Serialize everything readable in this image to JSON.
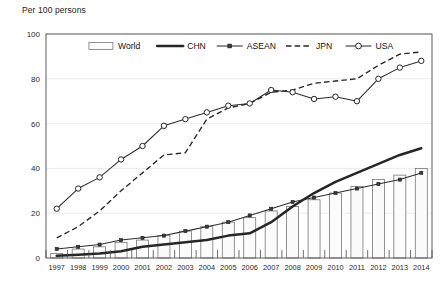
{
  "chart_data": {
    "type": "line",
    "title": "",
    "ylabel": "Per 100 persons",
    "xlabel": "",
    "ylim": [
      0,
      100
    ],
    "yticks": [
      0,
      20,
      40,
      60,
      80,
      100
    ],
    "grid": true,
    "legend_position": "top-center",
    "categories": [
      "1997",
      "1998",
      "1999",
      "2000",
      "2001",
      "2002",
      "2003",
      "2004",
      "2005",
      "2006",
      "2007",
      "2008",
      "2009",
      "2010",
      "2011",
      "2012",
      "2013",
      "2014"
    ],
    "x": [
      1997,
      1998,
      1999,
      2000,
      2001,
      2002,
      2003,
      2004,
      2005,
      2006,
      2007,
      2008,
      2009,
      2010,
      2011,
      2012,
      2013,
      2014
    ],
    "series": [
      {
        "name": "World",
        "type": "bar",
        "style": "hollow-bar",
        "color": "#fbfbfb",
        "edge_color": "#6e6e6e",
        "values": [
          2,
          4,
          5,
          7,
          8,
          10,
          12,
          14,
          16,
          18,
          21,
          23,
          26,
          29,
          32,
          35,
          37,
          40
        ]
      },
      {
        "name": "CHN",
        "type": "line",
        "style": "thick-solid",
        "color": "#262626",
        "values": [
          1,
          1.5,
          2,
          3,
          5,
          6,
          7,
          8,
          10,
          11,
          16,
          23,
          29,
          34,
          38,
          42,
          46,
          49
        ]
      },
      {
        "name": "ASEAN",
        "type": "line",
        "style": "solid-square-marker",
        "color": "#2d2d2d",
        "values": [
          4,
          5,
          6,
          8,
          9,
          10,
          12,
          14,
          16,
          19,
          22,
          25,
          27,
          29,
          31,
          33,
          35,
          38
        ]
      },
      {
        "name": "JPN",
        "type": "line",
        "style": "dashed",
        "color": "#262626",
        "values": [
          9,
          14,
          21,
          30,
          38,
          46,
          47,
          62,
          67,
          69,
          74,
          75,
          78,
          79,
          80,
          86,
          91,
          92
        ]
      },
      {
        "name": "USA",
        "type": "line",
        "style": "solid-circle-marker",
        "color": "#2d2d2d",
        "values": [
          22,
          31,
          36,
          44,
          50,
          59,
          62,
          65,
          68,
          69,
          75,
          74,
          71,
          72,
          70,
          80,
          85,
          88
        ]
      }
    ]
  },
  "axis": {
    "y_title": "Per 100 persons"
  },
  "legend": {
    "entries": [
      {
        "label": "World"
      },
      {
        "label": "CHN"
      },
      {
        "label": "ASEAN"
      },
      {
        "label": "JPN"
      },
      {
        "label": "USA"
      }
    ]
  }
}
